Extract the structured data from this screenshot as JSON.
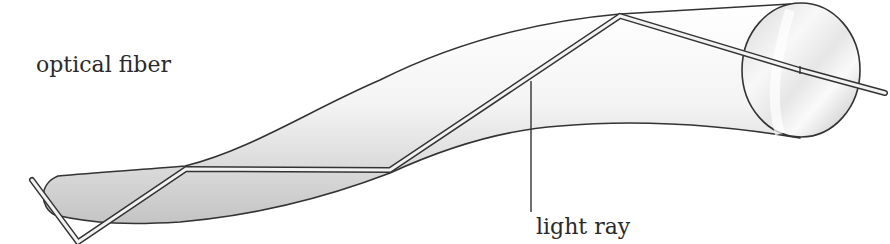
{
  "labels": {
    "fiber": "optical fiber",
    "ray": "light ray"
  },
  "colors": {
    "outline": "#333333",
    "fiber_fill_light": "#ffffff",
    "fiber_fill_shadow": "#c8c8c8",
    "ray_fill": "#f2f2f2",
    "background": "#ffffff"
  },
  "elements": {
    "fiber": "curved cylindrical optical fiber with circular cross-section end face",
    "ray": "light ray zig-zagging inside fiber via total internal reflection",
    "leader_line": "pointer connecting light ray label to ray"
  }
}
